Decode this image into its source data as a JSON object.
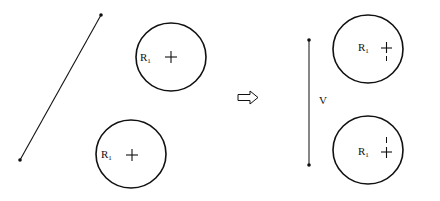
{
  "diagram": {
    "title": "",
    "before": {
      "segment": {
        "label": ""
      },
      "circles": [
        {
          "label_main": "R",
          "label_sub": "1",
          "has_cross": true,
          "tail": "none"
        },
        {
          "label_main": "R",
          "label_sub": "1",
          "has_cross": true,
          "tail": "none"
        }
      ]
    },
    "transition": {
      "icon": "hollow-right-arrow"
    },
    "after": {
      "segment": {
        "label": "V"
      },
      "circles": [
        {
          "label_main": "R",
          "label_sub": "1",
          "has_cross": true,
          "tail": "down"
        },
        {
          "label_main": "R",
          "label_sub": "1",
          "has_cross": true,
          "tail": "up"
        }
      ]
    },
    "colors": {
      "ink": "#111111",
      "background": "#ffffff"
    }
  }
}
